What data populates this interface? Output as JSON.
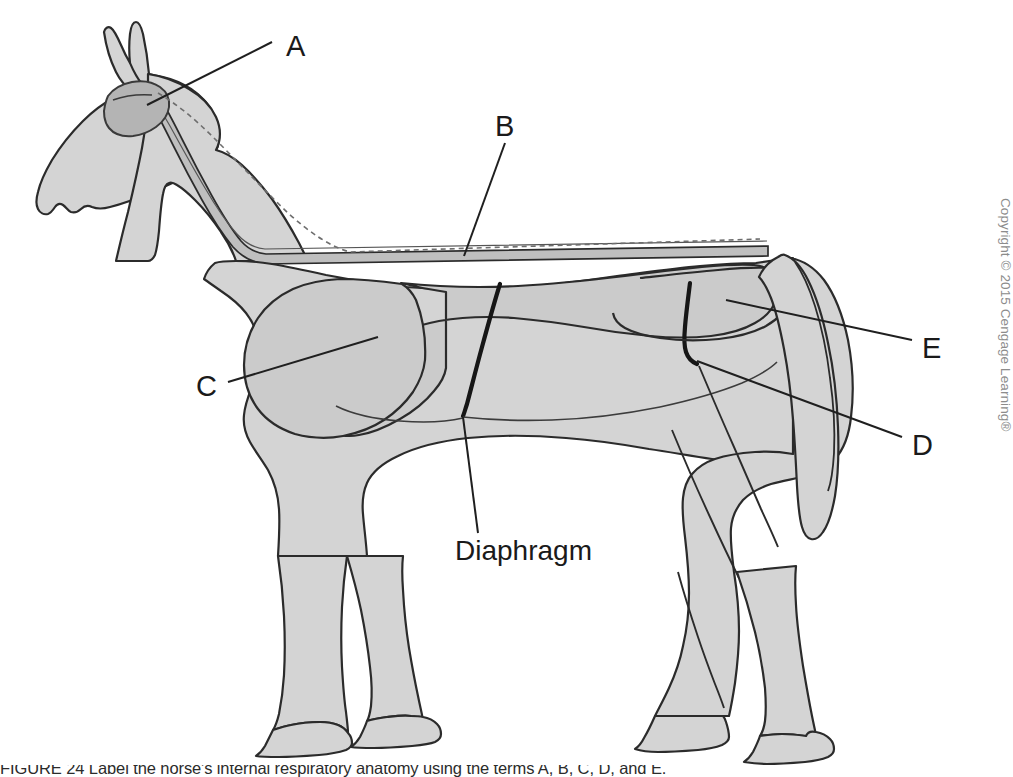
{
  "figure": {
    "body_fill": "#d4d4d4",
    "organ_fill": "#cacaca",
    "dark_fill": "#b6b6b6",
    "outline": "#2b2b2b",
    "leader_color": "#1f1f1f",
    "background": "#ffffff"
  },
  "labels": {
    "a": "A",
    "b": "B",
    "c": "C",
    "d": "D",
    "e": "E",
    "diaphragm": "Diaphragm"
  },
  "copyright": {
    "text": "Copyright © 2015 Cengage Learning®"
  },
  "caption": {
    "text": "FIGURE 24 Label the horse's internal respiratory anatomy using the terms A, B, C, D, and E."
  }
}
